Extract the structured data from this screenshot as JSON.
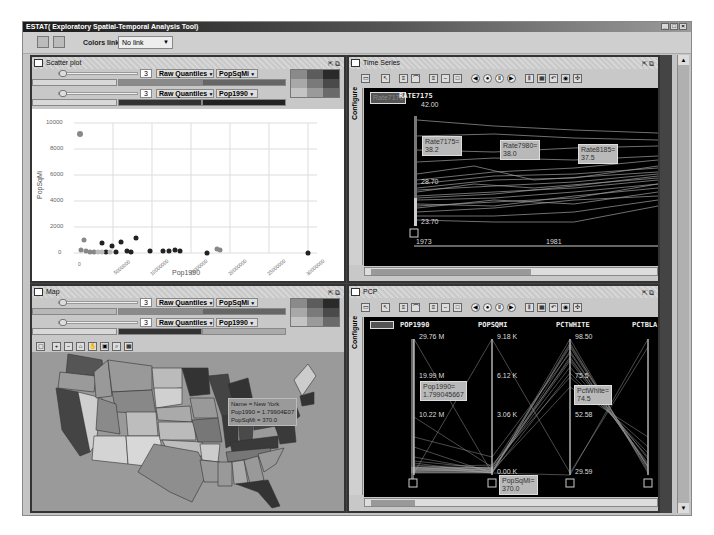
{
  "window": {
    "title": "ESTAT( Exploratory Spatial-Temporal Analysis Tool)",
    "controls": [
      "_",
      "□",
      "×"
    ]
  },
  "toolbar": {
    "icons": [
      "open-icon",
      "layout-icon"
    ],
    "colors_link_label": "Colors link:",
    "colors_link_value": "No link"
  },
  "scatter": {
    "title": "Scatter plot",
    "rows": [
      {
        "classes": "3",
        "method": "Raw Quantiles",
        "variable": "PopSqMi"
      },
      {
        "classes": "3",
        "method": "Raw Quantiles",
        "variable": "Pop1990"
      }
    ],
    "chart": {
      "ylabel": "PopSqMi",
      "xlabel": "Pop1990",
      "yticks": [
        "10000",
        "8000",
        "6000",
        "4000",
        "2000",
        "0"
      ],
      "xticks": [
        "0",
        "5000000",
        "10000000",
        "15000000",
        "20000000",
        "25000000",
        "30000000"
      ]
    }
  },
  "timeseries": {
    "title": "Time Series",
    "configure_tab": "Configure",
    "variable_label": "RATE7175",
    "hidden_label": "Rate7175",
    "yticks": [
      "42.00",
      "28.70",
      "23.70"
    ],
    "xticks": [
      "1973",
      "1981"
    ],
    "tooltips": [
      {
        "name": "Rate7175=",
        "value": "38.2"
      },
      {
        "name": "Rate7980=",
        "value": "38.0"
      },
      {
        "name": "Rate8185=",
        "value": "37.5"
      }
    ]
  },
  "map": {
    "title": "Map",
    "rows": [
      {
        "classes": "3",
        "method": "Raw Quantiles",
        "variable": "PopSqMi"
      },
      {
        "classes": "3",
        "method": "Raw Quantiles",
        "variable": "Pop1990"
      }
    ],
    "tools": [
      "select",
      "zoom-in",
      "zoom-out",
      "full-extent",
      "pan",
      "export",
      "identify",
      "table"
    ],
    "tooltip": {
      "line1": "Name = New York",
      "line2": "Pop1990 = 1.79904E07",
      "line3": "PopSqMi = 370.0"
    }
  },
  "pcp": {
    "title": "PCP",
    "configure_tab": "Configure",
    "axes": [
      {
        "name": "POP1990",
        "max": "29.76 M",
        "mid1": "19.99 M",
        "mid2": "10.22 M",
        "min": ""
      },
      {
        "name": "POPSQMI",
        "max": "9.18 K",
        "mid1": "6.12 K",
        "mid2": "3.06 K",
        "min": "0.00 K"
      },
      {
        "name": "PCTWHITE",
        "max": "98.50",
        "mid1": "75.5",
        "mid2": "52.58",
        "min": "29.59"
      },
      {
        "name": "PCTBLA",
        "max": "",
        "mid1": "",
        "mid2": "",
        "min": ""
      }
    ],
    "tooltips": [
      {
        "name": "Pop1990=",
        "value": "1.799045667"
      },
      {
        "name": "PctWhite=",
        "value": "74.5"
      },
      {
        "name": "PopSqMi=",
        "value": "370.0"
      }
    ]
  },
  "colors": {
    "legend": [
      "#8a8a8a",
      "#5c5c5c",
      "#2a2a2a",
      "#a8a8a8",
      "#7a7a7a",
      "#4a4a4a",
      "#c4c4c4",
      "#9a9a9a",
      "#6a6a6a"
    ]
  }
}
